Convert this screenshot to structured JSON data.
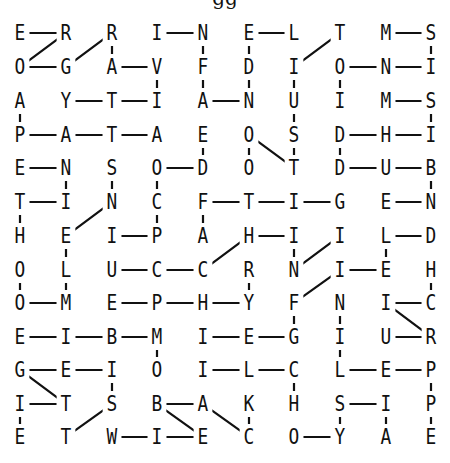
{
  "title_fragment": "gg",
  "grid": {
    "rows": 13,
    "cols": 10,
    "letters": [
      [
        "E",
        "R",
        "R",
        "I",
        "N",
        "E",
        "L",
        "T",
        "M",
        "S"
      ],
      [
        "O",
        "G",
        "A",
        "V",
        "F",
        "D",
        "I",
        "O",
        "N",
        "I"
      ],
      [
        "A",
        "Y",
        "T",
        "I",
        "A",
        "N",
        "U",
        "I",
        "M",
        "S"
      ],
      [
        "P",
        "A",
        "T",
        "A",
        "E",
        "O",
        "S",
        "D",
        "H",
        "I"
      ],
      [
        "E",
        "N",
        "S",
        "O",
        "D",
        "O",
        "T",
        "D",
        "U",
        "B"
      ],
      [
        "T",
        "I",
        "N",
        "C",
        "F",
        "T",
        "I",
        "G",
        "E",
        "N"
      ],
      [
        "H",
        "E",
        "I",
        "P",
        "A",
        "H",
        "I",
        "I",
        "L",
        "D"
      ],
      [
        "O",
        "L",
        "U",
        "C",
        "C",
        "R",
        "N",
        "I",
        "E",
        "H"
      ],
      [
        "O",
        "M",
        "E",
        "P",
        "H",
        "Y",
        "F",
        "N",
        "I",
        "C"
      ],
      [
        "E",
        "I",
        "B",
        "M",
        "I",
        "E",
        "G",
        "I",
        "U",
        "R"
      ],
      [
        "G",
        "E",
        "I",
        "O",
        "I",
        "L",
        "C",
        "L",
        "E",
        "P"
      ],
      [
        "I",
        "T",
        "S",
        "B",
        "A",
        "K",
        "H",
        "S",
        "I",
        "P"
      ],
      [
        "E",
        "T",
        "W",
        "I",
        "E",
        "C",
        "O",
        "Y",
        "A",
        "E"
      ]
    ]
  },
  "links": [
    [
      0,
      0,
      0,
      1
    ],
    [
      0,
      1,
      1,
      0
    ],
    [
      1,
      0,
      1,
      1
    ],
    [
      1,
      1,
      0,
      2
    ],
    [
      0,
      2,
      1,
      2
    ],
    [
      1,
      2,
      1,
      3
    ],
    [
      1,
      3,
      2,
      3
    ],
    [
      0,
      3,
      0,
      4
    ],
    [
      0,
      4,
      1,
      4
    ],
    [
      1,
      4,
      2,
      4
    ],
    [
      2,
      4,
      2,
      5
    ],
    [
      0,
      5,
      0,
      6
    ],
    [
      0,
      5,
      1,
      5
    ],
    [
      1,
      5,
      2,
      5
    ],
    [
      1,
      6,
      0,
      7
    ],
    [
      1,
      6,
      2,
      6
    ],
    [
      1,
      7,
      2,
      7
    ],
    [
      1,
      7,
      1,
      8
    ],
    [
      1,
      8,
      1,
      9
    ],
    [
      0,
      8,
      0,
      9
    ],
    [
      0,
      9,
      1,
      9
    ],
    [
      2,
      0,
      3,
      0
    ],
    [
      2,
      1,
      2,
      2
    ],
    [
      2,
      2,
      2,
      3
    ],
    [
      2,
      8,
      2,
      9
    ],
    [
      2,
      9,
      3,
      9
    ],
    [
      3,
      0,
      3,
      1
    ],
    [
      3,
      1,
      3,
      2
    ],
    [
      3,
      2,
      3,
      3
    ],
    [
      3,
      4,
      4,
      4
    ],
    [
      3,
      5,
      4,
      5
    ],
    [
      3,
      5,
      4,
      6
    ],
    [
      2,
      6,
      3,
      6
    ],
    [
      3,
      6,
      4,
      6
    ],
    [
      3,
      7,
      3,
      8
    ],
    [
      3,
      8,
      3,
      9
    ],
    [
      3,
      7,
      4,
      7
    ],
    [
      4,
      0,
      4,
      1
    ],
    [
      4,
      1,
      5,
      1
    ],
    [
      4,
      2,
      5,
      2
    ],
    [
      4,
      3,
      4,
      4
    ],
    [
      4,
      3,
      5,
      3
    ],
    [
      4,
      7,
      4,
      8
    ],
    [
      4,
      8,
      4,
      9
    ],
    [
      4,
      9,
      5,
      9
    ],
    [
      5,
      0,
      5,
      1
    ],
    [
      5,
      0,
      6,
      0
    ],
    [
      5,
      3,
      6,
      3
    ],
    [
      5,
      4,
      5,
      5
    ],
    [
      5,
      5,
      5,
      6
    ],
    [
      5,
      6,
      5,
      7
    ],
    [
      5,
      4,
      6,
      4
    ],
    [
      5,
      8,
      5,
      9
    ],
    [
      6,
      1,
      5,
      2
    ],
    [
      6,
      2,
      6,
      3
    ],
    [
      6,
      1,
      7,
      1
    ],
    [
      6,
      5,
      6,
      6
    ],
    [
      6,
      6,
      7,
      6
    ],
    [
      7,
      6,
      6,
      7
    ],
    [
      6,
      8,
      6,
      9
    ],
    [
      6,
      8,
      7,
      8
    ],
    [
      7,
      2,
      7,
      3
    ],
    [
      7,
      3,
      7,
      4
    ],
    [
      7,
      4,
      6,
      5
    ],
    [
      7,
      5,
      8,
      5
    ],
    [
      7,
      7,
      7,
      8
    ],
    [
      7,
      0,
      8,
      0
    ],
    [
      7,
      1,
      8,
      1
    ],
    [
      7,
      9,
      8,
      9
    ],
    [
      8,
      0,
      8,
      1
    ],
    [
      8,
      2,
      8,
      3
    ],
    [
      8,
      3,
      8,
      4
    ],
    [
      8,
      4,
      8,
      5
    ],
    [
      8,
      6,
      7,
      7
    ],
    [
      8,
      6,
      9,
      6
    ],
    [
      8,
      7,
      9,
      7
    ],
    [
      8,
      8,
      8,
      9
    ],
    [
      8,
      8,
      9,
      9
    ],
    [
      9,
      0,
      9,
      1
    ],
    [
      9,
      1,
      9,
      2
    ],
    [
      9,
      2,
      9,
      3
    ],
    [
      9,
      3,
      10,
      3
    ],
    [
      9,
      4,
      9,
      5
    ],
    [
      9,
      5,
      9,
      6
    ],
    [
      9,
      8,
      9,
      9
    ],
    [
      10,
      0,
      10,
      1
    ],
    [
      10,
      1,
      10,
      2
    ],
    [
      10,
      0,
      11,
      1
    ],
    [
      10,
      2,
      11,
      2
    ],
    [
      10,
      4,
      10,
      5
    ],
    [
      10,
      5,
      10,
      6
    ],
    [
      10,
      6,
      11,
      6
    ],
    [
      9,
      7,
      10,
      7
    ],
    [
      10,
      7,
      10,
      8
    ],
    [
      10,
      8,
      10,
      9
    ],
    [
      10,
      9,
      11,
      9
    ],
    [
      11,
      0,
      11,
      1
    ],
    [
      11,
      0,
      12,
      0
    ],
    [
      11,
      2,
      12,
      1
    ],
    [
      11,
      3,
      11,
      4
    ],
    [
      11,
      3,
      12,
      4
    ],
    [
      11,
      4,
      12,
      5
    ],
    [
      11,
      5,
      12,
      5
    ],
    [
      11,
      7,
      11,
      8
    ],
    [
      11,
      7,
      12,
      7
    ],
    [
      11,
      8,
      12,
      8
    ],
    [
      11,
      9,
      12,
      9
    ],
    [
      12,
      2,
      12,
      3
    ],
    [
      12,
      3,
      12,
      4
    ],
    [
      12,
      6,
      12,
      7
    ]
  ],
  "layout": {
    "col_x": [
      20,
      66,
      112,
      157,
      203,
      249,
      294,
      340,
      386,
      431
    ],
    "row_y": [
      33,
      67,
      101,
      135,
      168,
      202,
      236,
      270,
      303,
      337,
      370,
      404,
      437
    ]
  }
}
